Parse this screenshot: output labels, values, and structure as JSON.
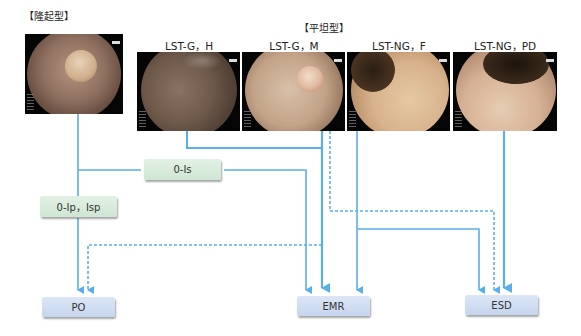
{
  "groups": {
    "protruded_label": "【隆起型】",
    "flat_label": "【平坦型】"
  },
  "images": [
    {
      "id": "protruded",
      "label": "",
      "desc": "endoscopic-image-protruded-polyp"
    },
    {
      "id": "lst-g-h",
      "label": "LST-G，H",
      "desc": "endoscopic-image-lst-g-homogeneous"
    },
    {
      "id": "lst-g-m",
      "label": "LST-G，M",
      "desc": "endoscopic-image-lst-g-mixed"
    },
    {
      "id": "lst-ng-f",
      "label": "LST-NG，F",
      "desc": "endoscopic-image-lst-ng-flat"
    },
    {
      "id": "lst-ng-pd",
      "label": "LST-NG，PD",
      "desc": "endoscopic-image-lst-ng-pseudo-depressed"
    }
  ],
  "morphology_boxes": {
    "is": "0-Ⅰs",
    "ip_isp": "0-Ⅰp，Ⅰsp"
  },
  "treatment_boxes": {
    "po": "PO",
    "emr": "EMR",
    "esd": "ESD"
  },
  "colors": {
    "line": "#5aaeea",
    "green_box": "#d5e9d9",
    "blue_box": "#cbd9f0"
  },
  "legend": {
    "solid": "recommended",
    "dashed": "alternative"
  }
}
